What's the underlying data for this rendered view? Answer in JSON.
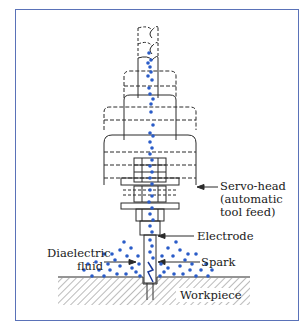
{
  "diagram": {
    "type": "Electrical discharge machining (EDM) setup",
    "frame_color": "#5a72b8",
    "dot_color": "#2a5cc8",
    "line_color": "#2a2a2a",
    "labels": {
      "servo_head": "Servo-head\n(automatic\ntool feed)",
      "electrode": "Electrode",
      "dielectric_fluid": "Diaelectric\nfluid",
      "spark": "Spark",
      "workpiece": "Workpiece"
    }
  }
}
